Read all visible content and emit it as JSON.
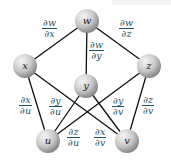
{
  "diagram": {
    "type": "tree-diagram",
    "nodes": [
      {
        "id": "w",
        "label": "w",
        "cx": 87,
        "cy": 21
      },
      {
        "id": "x",
        "label": "x",
        "cx": 25,
        "cy": 66
      },
      {
        "id": "y",
        "label": "y",
        "cx": 86,
        "cy": 86
      },
      {
        "id": "z",
        "label": "z",
        "cx": 149,
        "cy": 66
      },
      {
        "id": "u",
        "label": "u",
        "cx": 48,
        "cy": 141
      },
      {
        "id": "v",
        "label": "v",
        "cx": 127,
        "cy": 141
      }
    ],
    "edges": [
      {
        "from": "w",
        "to": "x",
        "label": {
          "num": "∂w",
          "den": "∂x"
        },
        "lx": 42,
        "ly": 18
      },
      {
        "from": "w",
        "to": "y",
        "label": {
          "num": "∂w",
          "den": "∂y"
        },
        "lx": 89,
        "ly": 40
      },
      {
        "from": "w",
        "to": "z",
        "label": {
          "num": "∂w",
          "den": "∂z"
        },
        "lx": 119,
        "ly": 18
      },
      {
        "from": "x",
        "to": "u",
        "label": {
          "num": "∂x",
          "den": "∂u"
        },
        "lx": 19,
        "ly": 95
      },
      {
        "from": "y",
        "to": "u",
        "label": {
          "num": "∂y",
          "den": "∂u"
        },
        "lx": 49,
        "ly": 96
      },
      {
        "from": "y",
        "to": "v",
        "label": {
          "num": "∂y",
          "den": "∂v"
        },
        "lx": 112,
        "ly": 96
      },
      {
        "from": "z",
        "to": "v",
        "label": {
          "num": "∂z",
          "den": "∂v"
        },
        "lx": 142,
        "ly": 95
      },
      {
        "from": "z",
        "to": "u",
        "label": {
          "num": "∂z",
          "den": "∂u"
        },
        "lx": 67,
        "ly": 127
      },
      {
        "from": "x",
        "to": "v",
        "label": {
          "num": "∂x",
          "den": "∂v"
        },
        "lx": 94,
        "ly": 127
      }
    ],
    "colors": {
      "edge": "#111111",
      "label_text": "#1f5560",
      "sphere_light": "#f4f4f4",
      "sphere_dark": "#8a8a8a"
    }
  }
}
